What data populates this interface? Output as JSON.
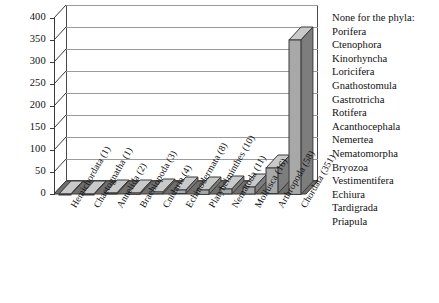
{
  "chart_data": {
    "type": "bar",
    "title": "",
    "xlabel": "",
    "ylabel": "",
    "ylim": [
      0,
      400
    ],
    "ytick_step": 50,
    "grid": true,
    "legend_position": "right",
    "categories": [
      "Hemichordata (1)",
      "Chaetognatha (1)",
      "Annelida (2)",
      "Brachiopoda (3)",
      "Cnidaria (4)",
      "Echinodermata (8)",
      "Platyhelminthes (10)",
      "Nematoda (11)",
      "Mollusca (16)",
      "Arthropoda (58)",
      "Chordata (351)"
    ],
    "values": [
      1,
      1,
      2,
      3,
      4,
      8,
      10,
      11,
      16,
      58,
      351
    ],
    "ytick_labels": [
      "0",
      "50",
      "100",
      "150",
      "200",
      "250",
      "300",
      "350",
      "400"
    ],
    "bar_color": "#a8a8a8",
    "bar_top_color": "#c9c9c9",
    "bar_side_color": "#7d7d7d",
    "floor_color": "#6e6e6e",
    "axis_color": "#3a3a3a",
    "grid_color": "#9b9b9b"
  },
  "legend": {
    "heading": "None for the phyla:",
    "items": [
      "Porifera",
      "Ctenophora",
      "Kinorhyncha",
      "Loricifera",
      "Gnathostomula",
      "Gastrotricha",
      "Rotifera",
      "Acanthocephala",
      "Nemertea",
      "Nematomorpha",
      "Bryozoa",
      "Vestimentifera",
      "Echiura",
      "Tardigrada",
      "Priapula"
    ]
  }
}
